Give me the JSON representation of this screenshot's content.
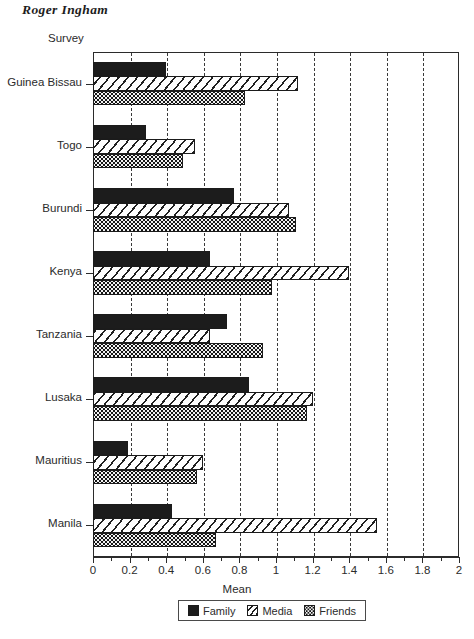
{
  "running_head": "Roger Ingham",
  "chart_data": {
    "type": "bar",
    "orientation": "horizontal",
    "title": "",
    "xlabel": "Mean",
    "ylabel": "Survey",
    "xlim": [
      0,
      2
    ],
    "xticks": [
      0,
      0.2,
      0.4,
      0.6,
      0.8,
      1,
      1.2,
      1.4,
      1.6,
      1.8,
      2
    ],
    "xtick_labels": [
      "0",
      "0.2",
      "0.4",
      "0.6",
      "0.8",
      "1",
      "1.2",
      "1.4",
      "1.6",
      "1.8",
      "2"
    ],
    "grid": "vertical-dashed",
    "legend_position": "below-axis",
    "categories": [
      "Guinea Bissau",
      "Togo",
      "Burundi",
      "Kenya",
      "Tanzania",
      "Lusaka",
      "Mauritius",
      "Manila"
    ],
    "series": [
      {
        "name": "Family",
        "fill": "solid-black",
        "color": "#1c1c1c",
        "values": [
          0.4,
          0.29,
          0.77,
          0.64,
          0.73,
          0.85,
          0.19,
          0.43
        ]
      },
      {
        "name": "Media",
        "fill": "diagonal-hatch",
        "color": "#1f1f1f",
        "values": [
          1.12,
          0.56,
          1.07,
          1.4,
          0.64,
          1.2,
          0.6,
          1.55
        ]
      },
      {
        "name": "Friends",
        "fill": "dotted-grid",
        "color": "#151515",
        "values": [
          0.83,
          0.49,
          1.11,
          0.98,
          0.93,
          1.17,
          0.57,
          0.67
        ]
      }
    ]
  },
  "legend": {
    "items": [
      {
        "label": "Family",
        "swatch": "solid-black-swatch"
      },
      {
        "label": "Media",
        "swatch": "hatched-swatch"
      },
      {
        "label": "Friends",
        "swatch": "dotted-swatch"
      }
    ]
  }
}
